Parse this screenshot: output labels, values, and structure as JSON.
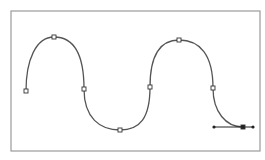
{
  "diagram": {
    "type": "bezier-path-editor",
    "frame": {
      "x": 11,
      "y": 11,
      "width": 249,
      "height": 140,
      "stroke": "#9a9a9a"
    },
    "path": {
      "stroke": "#555555",
      "d": "M26,91 C26,60 36,37 54,37 C74,37 84,55 84,89 C84,118 100,130 120,130 C140,130 150,118 150,87 C150,55 160,40 179,40 C200,40 213,55 213,88 C213,112 226,127 243,127"
    },
    "anchors": [
      {
        "x": 26,
        "y": 91
      },
      {
        "x": 54,
        "y": 37
      },
      {
        "x": 84,
        "y": 89
      },
      {
        "x": 120,
        "y": 130
      },
      {
        "x": 150,
        "y": 87
      },
      {
        "x": 179,
        "y": 40
      },
      {
        "x": 213,
        "y": 88
      },
      {
        "x": 243,
        "y": 127,
        "selected": true
      }
    ],
    "handle": {
      "x1": 214,
      "y1": 127,
      "x2": 253,
      "y2": 127,
      "anchor_x": 243
    }
  }
}
